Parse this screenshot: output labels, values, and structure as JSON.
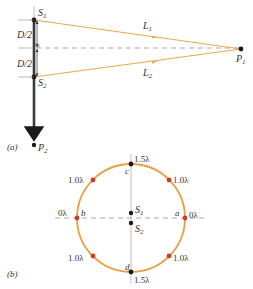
{
  "colors": {
    "ray": "#e8a94a",
    "circle": "#e8a040",
    "red_point": "#d43a20",
    "black": "#1a1a1a",
    "dashed": "#9aa0a8",
    "axis": "#b0b0b0"
  },
  "part_a": {
    "panel_label": "(a)",
    "source_top": {
      "letter": "S",
      "sub": "1"
    },
    "source_bottom": {
      "letter": "S",
      "sub": "2"
    },
    "half_spacing_top": "D/2",
    "half_spacing_bottom": "D/2",
    "path_top": {
      "letter": "L",
      "sub": "1"
    },
    "path_bottom": {
      "letter": "L",
      "sub": "2"
    },
    "point_far": {
      "letter": "P",
      "sub": "1"
    },
    "point_axis": {
      "letter": "P",
      "sub": "2"
    }
  },
  "part_b": {
    "panel_label": "(b)",
    "source_top": {
      "letter": "S",
      "sub": "1"
    },
    "source_bottom": {
      "letter": "S",
      "sub": "2"
    },
    "points": [
      {
        "name": "a",
        "value": "0λ"
      },
      {
        "name": "b",
        "value": "0λ"
      },
      {
        "name": "c",
        "value": "1.5λ"
      },
      {
        "name": "d",
        "value": "1.5λ"
      }
    ],
    "upper_right": "1.0λ",
    "upper_left": "1.0λ",
    "lower_right": "1.0λ",
    "lower_left": "1.0λ"
  }
}
